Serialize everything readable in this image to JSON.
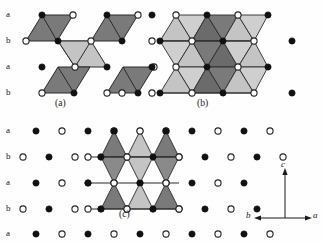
{
  "figure": {
    "title": "",
    "type": "crystal-structure-polyhedra-diagram",
    "panels": [
      {
        "id": "a",
        "label": "(a)",
        "label_x": 55,
        "label_y": 99,
        "description": "isolated edge-sharing octahedra pairs linked by a light central rhombus"
      },
      {
        "id": "b",
        "label": "(b)",
        "label_x": 197,
        "label_y": 99,
        "description": "continuous sheet of edge-sharing octahedra, alternating light and dark bands"
      },
      {
        "id": "c",
        "label": "(c)",
        "label_x": 119,
        "label_y": 208,
        "description": "triangular sheet of alternating up and down polyhedra on a dot lattice"
      }
    ],
    "row_labels_top": [
      {
        "text": "a",
        "x": 6,
        "y": 10
      },
      {
        "text": "b",
        "x": 6,
        "y": 37
      },
      {
        "text": "a",
        "x": 6,
        "y": 63
      },
      {
        "text": "b",
        "x": 6,
        "y": 89
      }
    ],
    "row_labels_bottom": [
      {
        "text": "a",
        "x": 6,
        "y": 131
      },
      {
        "text": "b",
        "x": 6,
        "y": 157
      },
      {
        "text": "a",
        "x": 6,
        "y": 183
      },
      {
        "text": "b",
        "x": 6,
        "y": 209
      },
      {
        "text": "a",
        "x": 6,
        "y": 234
      }
    ],
    "axes": {
      "origin_x": 285,
      "origin_y": 218,
      "labels": [
        {
          "text": "c",
          "x": 281,
          "y": 165,
          "direction": "up"
        },
        {
          "text": "b",
          "x": 249,
          "y": 213,
          "direction": "left"
        },
        {
          "text": "a",
          "x": 312,
          "y": 213,
          "direction": "right"
        }
      ]
    },
    "colors": {
      "dark_fill": "#7a7a7a",
      "darker_fill": "#6b6b6b",
      "light_fill": "#c4c4c4",
      "lighter_fill": "#cfcfcf",
      "mid_fill": "#9a9a9a",
      "edge": "#2a2a2a",
      "atom_filled": "#111111",
      "atom_open": "#ffffff",
      "atom_stroke": "#222222",
      "background": "#ffffff"
    },
    "atom_legend": {
      "filled_circle": "filled-atom-site",
      "open_circle": "open-atom-site"
    }
  }
}
